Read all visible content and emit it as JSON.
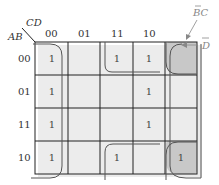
{
  "kmap": {
    "row_var": "AB",
    "col_var": "CD",
    "col_labels": [
      "00",
      "01",
      "11",
      "10"
    ],
    "row_labels": [
      "00",
      "01",
      "11",
      "10"
    ],
    "cells": [
      [
        "1",
        "",
        "1",
        "1"
      ],
      [
        "1",
        "",
        "",
        "1"
      ],
      [
        "1",
        "",
        "",
        "1"
      ],
      [
        "1",
        "",
        "1",
        "1"
      ]
    ],
    "groups": [
      {
        "name": "D-bar",
        "label": "D",
        "overbar": true,
        "cells": "columns 00 and 10 (all rows)"
      },
      {
        "name": "B-bar-C",
        "label": "BC",
        "overbar_on": "B",
        "cells": "corners (00,11),(00,10),(10,11),(10,10)"
      }
    ],
    "annotations": {
      "bc_label": "BC",
      "d_label": "D"
    },
    "colors": {
      "grid": "#222222",
      "group_outline": "#555555",
      "shaded_cell": "#c8c8c8",
      "shadow": "#e4e4e4"
    }
  }
}
